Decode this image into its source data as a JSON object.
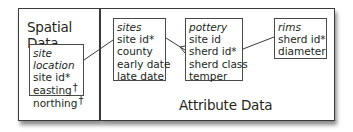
{
  "panels": {
    "spatial": {
      "title": "Spatial Data"
    },
    "attribute": {
      "title": "Attribute Data"
    }
  },
  "entities": {
    "site_location": {
      "name": "site location",
      "fields": [
        "site id*",
        "easting",
        "northing"
      ],
      "dagger": "†"
    },
    "sites": {
      "name": "sites",
      "fields": [
        "site id*",
        "county",
        "early date",
        "late date"
      ]
    },
    "pottery": {
      "name": "pottery",
      "fields": [
        "site id",
        "sherd id*",
        "sherd class",
        "temper"
      ]
    },
    "rims": {
      "name": "rims",
      "fields": [
        "sherd id*",
        "diameter"
      ]
    }
  },
  "relationships": [
    {
      "from": "site location",
      "to": "sites",
      "type": "one-to-one"
    },
    {
      "from": "sites",
      "to": "pottery",
      "type": "one-to-many"
    },
    {
      "from": "pottery",
      "to": "rims",
      "type": "one-to-one"
    }
  ]
}
